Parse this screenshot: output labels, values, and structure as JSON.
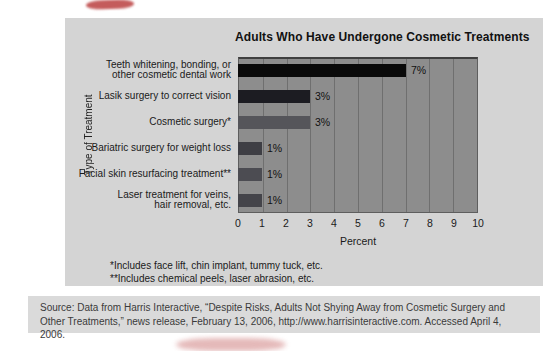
{
  "figure": {
    "panel_bg": "#d4d4d4",
    "source_bg": "#dadada",
    "footnotes": {
      "line1": "*Includes face lift, chin implant, tummy tuck, etc.",
      "line2": "**Includes chemical peels, laser abrasion, etc."
    },
    "source_text": "Source: Data from Harris Interactive, “Despite Risks, Adults Not Shying Away from Cosmetic Surgery and Other Treatments,” news release, February 13, 2006, http://www.harrisinteractive.com. Accessed April 4, 2006."
  },
  "chart_data": {
    "type": "bar",
    "orientation": "horizontal",
    "title": "Adults Who Have Undergone Cosmetic Treatments",
    "categories": [
      "Teeth whitening, bonding, or\nother cosmetic dental work",
      "Lasik surgery to correct vision",
      "Cosmetic surgery*",
      "Bariatric surgery for weight loss",
      "Facial skin resurfacing treatment**",
      "Laser treatment for veins,\nhair removal, etc."
    ],
    "values": [
      7,
      3,
      3,
      1,
      1,
      1
    ],
    "value_labels": [
      "7%",
      "3%",
      "3%",
      "1%",
      "1%",
      "1%"
    ],
    "bar_colors": [
      "#0a0a0a",
      "#1c1c22",
      "#55555a",
      "#3e3e44",
      "#4c4c52",
      "#44444a"
    ],
    "xlabel": "Percent",
    "ylabel": "Type of Treatment",
    "xlim": [
      0,
      10
    ],
    "xticks": [
      0,
      1,
      2,
      3,
      4,
      5,
      6,
      7,
      8,
      9,
      10
    ],
    "grid": true,
    "legend": "none",
    "plot_bg": "#8d8d8d",
    "grid_color": "#6f6f6f"
  },
  "scan_marks": {
    "top_color": "#b63434",
    "bottom_color": "#cf8080"
  }
}
